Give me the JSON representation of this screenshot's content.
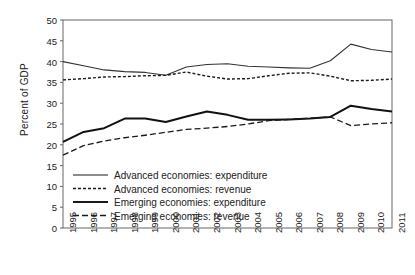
{
  "chart_data": {
    "type": "line",
    "title": "",
    "xlabel": "",
    "ylabel": "Percent of GDP",
    "ylim": [
      0,
      50
    ],
    "yticks": [
      0,
      5,
      10,
      15,
      20,
      25,
      30,
      35,
      40,
      45,
      50
    ],
    "grid": false,
    "legend_position": "lower-left-inside",
    "categories": [
      "1995",
      "1996",
      "1997",
      "1998",
      "1999",
      "2000",
      "2001",
      "2002",
      "2003",
      "2004",
      "2005",
      "2006",
      "2007",
      "2008",
      "2009",
      "2010",
      "2011"
    ],
    "series": [
      {
        "name": "Advanced economies: expenditure",
        "style": "solid-thin",
        "color": "#333333",
        "values": [
          40.0,
          39.0,
          38.0,
          37.6,
          37.4,
          36.7,
          38.7,
          39.3,
          39.5,
          38.9,
          38.7,
          38.5,
          38.4,
          40.2,
          44.2,
          42.9,
          42.3
        ]
      },
      {
        "name": "Advanced economies: revenue",
        "style": "dotted",
        "color": "#1a1a1a",
        "values": [
          35.6,
          35.9,
          36.3,
          36.4,
          36.6,
          36.7,
          37.5,
          36.5,
          35.8,
          35.9,
          36.6,
          37.2,
          37.3,
          36.5,
          35.4,
          35.5,
          35.8
        ]
      },
      {
        "name": "Emerging economies: expenditure",
        "style": "solid-thick",
        "color": "#111111",
        "values": [
          20.7,
          23.1,
          24.0,
          26.3,
          26.3,
          25.5,
          26.8,
          28.0,
          27.2,
          26.0,
          26.0,
          26.1,
          26.3,
          26.7,
          29.4,
          28.6,
          28.0
        ]
      },
      {
        "name": "Emerging economies: revenue",
        "style": "dashed",
        "color": "#1a1a1a",
        "values": [
          17.5,
          19.8,
          20.9,
          21.7,
          22.3,
          23.0,
          23.7,
          24.0,
          24.4,
          25.0,
          25.8,
          26.1,
          26.4,
          26.7,
          24.6,
          25.0,
          25.3
        ]
      }
    ]
  },
  "axes": {
    "y_axis_label": "Percent of GDP",
    "y_tick_labels": [
      "0",
      "5",
      "10",
      "15",
      "20",
      "25",
      "30",
      "35",
      "40",
      "45",
      "50"
    ],
    "x_tick_labels": [
      "1995",
      "1996",
      "1997",
      "1998",
      "1999",
      "2000",
      "2001",
      "2002",
      "2003",
      "2004",
      "2005",
      "2006",
      "2007",
      "2008",
      "2009",
      "2010",
      "2011"
    ]
  },
  "legend": {
    "items": [
      {
        "label": "Advanced economies: expenditure",
        "style": "solid-thin"
      },
      {
        "label": "Advanced economies: revenue",
        "style": "dotted"
      },
      {
        "label": "Emerging economies: expenditure",
        "style": "solid-thick"
      },
      {
        "label": "Emerging economies: revenue",
        "style": "dashed"
      }
    ]
  },
  "colors": {
    "frame": "#555555",
    "text": "#222222",
    "background": "#ffffff"
  }
}
